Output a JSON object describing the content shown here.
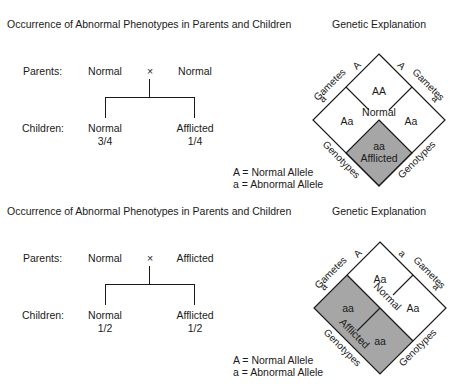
{
  "panels": [
    {
      "title": "Occurrence of Abnormal Phenotypes in Parents and Children",
      "explanation_title": "Genetic Explanation",
      "parents_label": "Parents:",
      "parent_left": "Normal",
      "cross_symbol": "×",
      "parent_right": "Normal",
      "children_label": "Children:",
      "child_left": "Normal",
      "child_left_ratio": "3/4",
      "child_right": "Afflicted",
      "child_right_ratio": "1/4",
      "legend": [
        "A = Normal Allele",
        "a = Abnormal Allele"
      ],
      "punnett": {
        "gametes_label": "Gametes",
        "genotypes_label": "Genotypes",
        "left_gametes": [
          "A",
          "a"
        ],
        "right_gametes": [
          "A",
          "a"
        ],
        "cells": [
          "AA",
          "Aa",
          "Aa",
          "aa"
        ],
        "normal_label": "Normal",
        "afflicted_label": "Afflicted"
      }
    },
    {
      "title": "Occurrence of Abnormal Phenotypes in Parents and Children",
      "explanation_title": "Genetic Explanation",
      "parents_label": "Parents:",
      "parent_left": "Normal",
      "cross_symbol": "×",
      "parent_right": "Afflicted",
      "children_label": "Children:",
      "child_left": "Normal",
      "child_left_ratio": "1/2",
      "child_right": "Afflicted",
      "child_right_ratio": "1/2",
      "legend": [
        "A = Normal Allele",
        "a = Abnormal Allele"
      ],
      "punnett": {
        "gametes_label": "Gametes",
        "genotypes_label": "Genotypes",
        "left_gametes": [
          "A",
          "a"
        ],
        "right_gametes": [
          "a",
          "a"
        ],
        "cells": [
          "Aa",
          "aa",
          "Aa",
          "aa"
        ],
        "normal_label": "Normal",
        "afflicted_label": "Afflicted"
      }
    }
  ],
  "colors": {
    "afflicted_fill": "#a6a6a6",
    "line": "#1a1a1a",
    "background": "#ffffff"
  }
}
